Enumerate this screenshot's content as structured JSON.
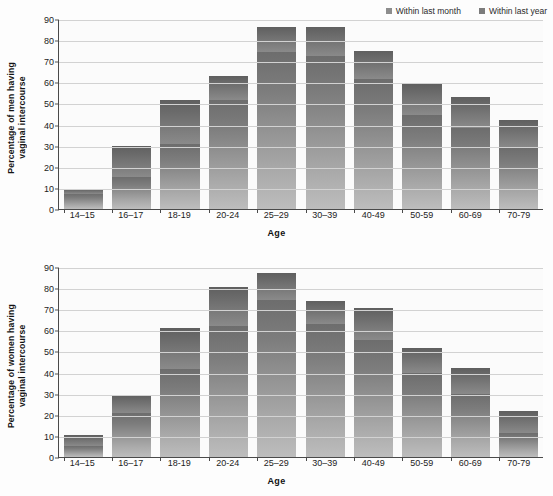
{
  "legend": {
    "items": [
      {
        "label": "Within last month",
        "icon": "square-swatch-icon",
        "color": "#8d8d8d"
      },
      {
        "label": "Within last year",
        "icon": "square-swatch-icon",
        "color": "#7c7c7c"
      }
    ]
  },
  "chart_data": [
    {
      "type": "bar",
      "id": "men",
      "title": "",
      "stacked": true,
      "xlabel": "Age",
      "ylabel": "Percentage of men having\nvaginal intercourse",
      "ylim": [
        0,
        90
      ],
      "yticks": [
        0,
        10,
        20,
        30,
        40,
        50,
        60,
        70,
        80,
        90
      ],
      "grid": true,
      "legend_position": "top-right",
      "categories": [
        "14–15",
        "16–17",
        "18-19",
        "20-24",
        "25–29",
        "30–39",
        "40-49",
        "50-59",
        "60-69",
        "70-79"
      ],
      "series": [
        {
          "name": "Within last month",
          "values": [
            7,
            15,
            31,
            51.5,
            74.5,
            72.5,
            61.5,
            44.5,
            38.5,
            29
          ]
        },
        {
          "name": "Within last year",
          "values": [
            9.5,
            30,
            51.5,
            63,
            86,
            86,
            75,
            59,
            53,
            42
          ]
        }
      ]
    },
    {
      "type": "bar",
      "id": "women",
      "title": "",
      "stacked": true,
      "xlabel": "Age",
      "ylabel": "Percentage of women having\nvaginal intercourse",
      "ylim": [
        0,
        90
      ],
      "yticks": [
        0,
        10,
        20,
        30,
        40,
        50,
        60,
        70,
        80,
        90
      ],
      "grid": true,
      "legend_position": "none",
      "categories": [
        "14–15",
        "16–17",
        "18-19",
        "20-24",
        "25–29",
        "30–39",
        "40-49",
        "50-59",
        "60-69",
        "70-79"
      ],
      "series": [
        {
          "name": "Within last month",
          "values": [
            5,
            21,
            41.5,
            62,
            74.5,
            63,
            55.5,
            40,
            30,
            11.5
          ]
        },
        {
          "name": "Within last year",
          "values": [
            10.5,
            29.5,
            61,
            80.5,
            87,
            74,
            70.5,
            51.5,
            42,
            22
          ]
        }
      ]
    }
  ]
}
